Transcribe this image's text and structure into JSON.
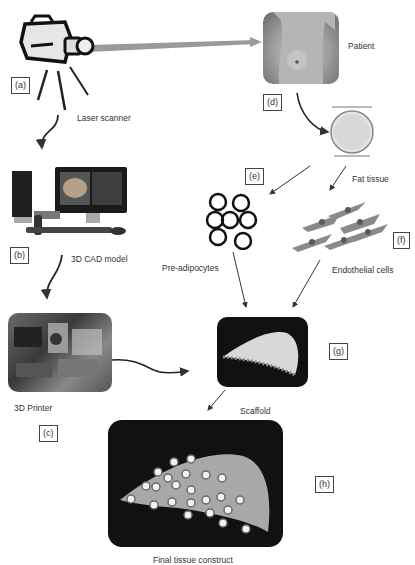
{
  "figure": {
    "steps": [
      {
        "tag": "(a)",
        "label": "Laser scanner",
        "icon": "laser-scanner-camera"
      },
      {
        "tag": "(b)",
        "label": "3D CAD model",
        "icon": "desktop-computer"
      },
      {
        "tag": "(c)",
        "label": "3D Printer",
        "icon": "3d-printer-photo"
      },
      {
        "tag": "(d)",
        "label": "Patient",
        "icon": "patient-torso-photo"
      },
      {
        "tag": "",
        "label": "Fat tissue",
        "icon": "petri-dish"
      },
      {
        "tag": "(e)",
        "label": "Pre-adipocytes",
        "icon": "cell-rings"
      },
      {
        "tag": "(f)",
        "label": "Endothelial cells",
        "icon": "spindle-cells"
      },
      {
        "tag": "(g)",
        "label": "Scaffold",
        "icon": "scaffold-render"
      },
      {
        "tag": "(h)",
        "label": "Final tissue construct",
        "icon": "seeded-scaffold-render"
      }
    ],
    "colors": {
      "arrow": "#333333",
      "beam": "#9a9a9a",
      "panel_dark": "#111111",
      "scaffold": "#d8d8d8",
      "cells_endothelial": "#8a8a8a"
    }
  }
}
